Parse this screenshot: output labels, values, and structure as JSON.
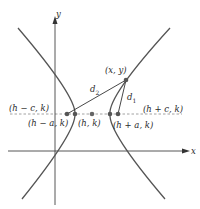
{
  "diagram": {
    "type": "hyperbola-foci-definition",
    "axes": {
      "x_label": "x",
      "y_label": "y"
    },
    "points": {
      "left_focus": "(h − c, k)",
      "left_vertex": "(h − a, k)",
      "center": "(h, k)",
      "right_vertex": "(h + a, k)",
      "right_focus": "(h + c, k)",
      "point_on_curve": "(x, y)"
    },
    "distances": {
      "d1": "d",
      "d1_sub": "1",
      "d2": "d",
      "d2_sub": "2"
    },
    "colors": {
      "curve": "#555555",
      "axis": "#444444",
      "dashed": "#888888",
      "point": "#555555"
    }
  }
}
